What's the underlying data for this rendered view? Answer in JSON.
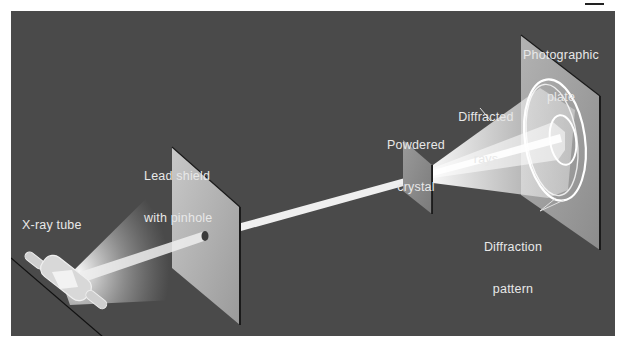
{
  "figure": {
    "colors": {
      "background": "#4a4a4a",
      "beam": "#f2f2f2",
      "plate": "#a6a6a6",
      "label_text": "#e8e8e8"
    }
  },
  "labels": {
    "xray_tube": "X-ray tube",
    "lead_shield_line1": "Lead shield",
    "lead_shield_line2": "with pinhole",
    "powdered_crystal_line1": "Powdered",
    "powdered_crystal_line2": "crystal",
    "diffracted_rays_line1": "Diffracted",
    "diffracted_rays_line2": "rays",
    "photographic_plate_line1": "Photographic",
    "photographic_plate_line2": "plate",
    "diffraction_pattern_line1": "Diffraction",
    "diffraction_pattern_line2": "pattern"
  },
  "components": [
    {
      "name": "X-ray tube",
      "role": "source"
    },
    {
      "name": "Lead shield with pinhole",
      "role": "collimator"
    },
    {
      "name": "Powdered crystal",
      "role": "sample"
    },
    {
      "name": "Diffracted rays",
      "role": "scattered beam"
    },
    {
      "name": "Photographic plate",
      "role": "detector"
    },
    {
      "name": "Diffraction pattern",
      "role": "result"
    }
  ]
}
